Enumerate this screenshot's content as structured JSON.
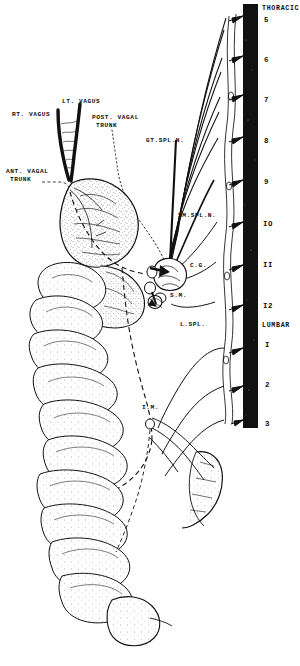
{
  "figure": {
    "ink_color": "#111111",
    "background_color": "#ffffff"
  },
  "spine": {
    "name": "vertebral-column",
    "color": "#111111",
    "region_labels": [
      {
        "text": "THORACIC",
        "x": 264,
        "y": 8
      },
      {
        "text": "LUMBAR",
        "x": 264,
        "y": 326
      }
    ],
    "levels": [
      {
        "label": "5",
        "x": 264,
        "y": 20,
        "ray_y": 16
      },
      {
        "label": "6",
        "x": 264,
        "y": 60,
        "ray_y": 56
      },
      {
        "label": "7",
        "x": 264,
        "y": 99,
        "ray_y": 95
      },
      {
        "label": "8",
        "x": 264,
        "y": 140,
        "ray_y": 137
      },
      {
        "label": "9",
        "x": 264,
        "y": 182,
        "ray_y": 180
      },
      {
        "label": "IO",
        "x": 264,
        "y": 224,
        "ray_y": 222
      },
      {
        "label": "II",
        "x": 264,
        "y": 265,
        "ray_y": 265
      },
      {
        "label": "I2",
        "x": 264,
        "y": 306,
        "ray_y": 305
      },
      {
        "label": "I",
        "x": 264,
        "y": 345,
        "ray_y": 348
      },
      {
        "label": "2",
        "x": 264,
        "y": 385,
        "ray_y": 386
      },
      {
        "label": "3",
        "x": 264,
        "y": 424,
        "ray_y": 420
      }
    ]
  },
  "nerve_labels": [
    {
      "id": "rt-vagus",
      "text": "RT. VAGUS",
      "x": 12,
      "y": 114
    },
    {
      "id": "lt-vagus",
      "text": "LT. VAGUS",
      "x": 62,
      "y": 100
    },
    {
      "id": "post-vagal-trunk",
      "text": "POST. VAGAL",
      "x": 94,
      "y": 116
    },
    {
      "id": "post-vagal-trunk2",
      "text": "TRUNK",
      "x": 98,
      "y": 124
    },
    {
      "id": "gt-spl-n",
      "text": "GT.SPL.N.",
      "x": 148,
      "y": 140
    },
    {
      "id": "ant-vagal-trunk",
      "text": "ANT. VAGAL",
      "x": 6,
      "y": 170
    },
    {
      "id": "ant-vagal-trunk2",
      "text": "TRUNK",
      "x": 10,
      "y": 178
    },
    {
      "id": "sm-spl-n",
      "text": "SM.SPL.N.",
      "x": 179,
      "y": 214
    },
    {
      "id": "c-g",
      "text": "C.G.",
      "x": 190,
      "y": 264
    },
    {
      "id": "s-m",
      "text": "S.M.",
      "x": 170,
      "y": 294
    },
    {
      "id": "l-spl",
      "text": "L.SPL.",
      "x": 180,
      "y": 323
    },
    {
      "id": "i-m",
      "text": "I.M.",
      "x": 143,
      "y": 406
    }
  ]
}
